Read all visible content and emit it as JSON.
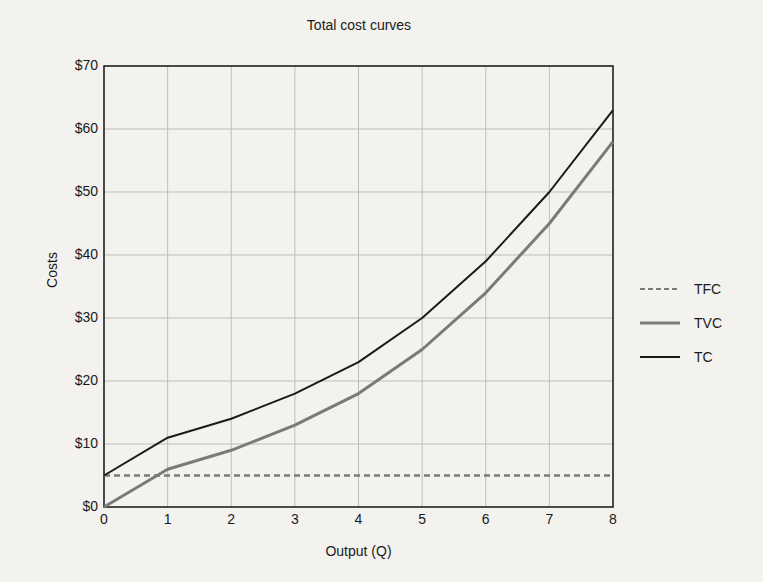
{
  "chart_data": {
    "type": "line",
    "title": "Total cost curves",
    "xlabel": "Output (Q)",
    "ylabel": "Costs",
    "x": [
      0,
      1,
      2,
      3,
      4,
      5,
      6,
      7,
      8
    ],
    "xlim": [
      0,
      8
    ],
    "ylim": [
      0,
      70
    ],
    "y_ticks": [
      "$0",
      "$10",
      "$20",
      "$30",
      "$40",
      "$50",
      "$60",
      "$70"
    ],
    "x_ticks": [
      "0",
      "1",
      "2",
      "3",
      "4",
      "5",
      "6",
      "7",
      "8"
    ],
    "grid": true,
    "legend_position": "right",
    "series": [
      {
        "name": "TFC",
        "style": "dashed",
        "color": "#7a7a7a",
        "values": [
          5,
          5,
          5,
          5,
          5,
          5,
          5,
          5,
          5
        ]
      },
      {
        "name": "TVC",
        "style": "solid",
        "color": "#7a7a7a",
        "values": [
          0,
          6,
          9,
          13,
          18,
          25,
          34,
          45,
          58
        ]
      },
      {
        "name": "TC",
        "style": "solid",
        "color": "#1a1a1a",
        "values": [
          5,
          11,
          14,
          18,
          23,
          30,
          39,
          50,
          63
        ]
      }
    ]
  },
  "legend": {
    "items": [
      {
        "label": "TFC"
      },
      {
        "label": "TVC"
      },
      {
        "label": "TC"
      }
    ]
  }
}
